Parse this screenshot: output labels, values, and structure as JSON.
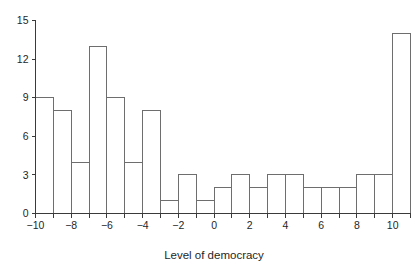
{
  "chart_data": {
    "type": "bar",
    "title": "",
    "subtitle": "",
    "xlabel": "Level of democracy",
    "ylabel": "",
    "xlim": [
      -10,
      11
    ],
    "ylim": [
      0,
      15
    ],
    "grid": false,
    "legend": null,
    "bin_width": 1,
    "bin_edges": [
      -10,
      -9,
      -8,
      -7,
      -6,
      -5,
      -4,
      -3,
      -2,
      -1,
      0,
      1,
      2,
      3,
      4,
      5,
      6,
      7,
      8,
      9,
      10,
      11
    ],
    "categories": [
      "-10 to -9",
      "-9 to -8",
      "-8 to -7",
      "-7 to -6",
      "-6 to -5",
      "-5 to -4",
      "-4 to -3",
      "-3 to -2",
      "-2 to -1",
      "-1 to 0",
      "0 to 1",
      "1 to 2",
      "2 to 3",
      "3 to 4",
      "4 to 5",
      "5 to 6",
      "6 to 7",
      "7 to 8",
      "8 to 9",
      "9 to 10",
      "10 to 11"
    ],
    "values": [
      9,
      8,
      4,
      13,
      9,
      4,
      8,
      1,
      3,
      1,
      2,
      3,
      2,
      3,
      3,
      2,
      2,
      2,
      3,
      3,
      14
    ],
    "x_ticks": [
      -10,
      -9,
      -8,
      -7,
      -6,
      -5,
      -4,
      -3,
      -2,
      -1,
      0,
      1,
      2,
      3,
      4,
      5,
      6,
      7,
      8,
      9,
      10,
      11
    ],
    "x_tick_labels": [
      "−10",
      "",
      "−8",
      "",
      "−6",
      "",
      "−4",
      "",
      "−2",
      "",
      "0",
      "",
      "2",
      "",
      "4",
      "",
      "6",
      "",
      "8",
      "",
      "10",
      ""
    ],
    "y_ticks": [
      0,
      3,
      6,
      9,
      12,
      15
    ],
    "y_tick_labels": [
      "0",
      "3",
      "6",
      "9",
      "12",
      "15"
    ],
    "colors": {
      "bar_fill": "#ffffff",
      "bar_stroke": "#6e6e6e",
      "axis": "#3a3a3a",
      "text": "#1f1f1f",
      "background": "#ffffff"
    }
  }
}
